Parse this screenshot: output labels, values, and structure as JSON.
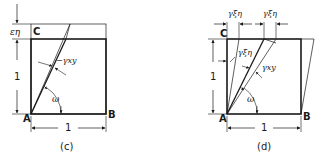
{
  "figures": [
    {
      "id": "c",
      "caption": "(c)",
      "vertices": {
        "A": "A",
        "B": "B",
        "C": "C"
      },
      "dimensions": {
        "height": "1",
        "width": "1",
        "top_offset": "εη"
      },
      "angles": {
        "shear": "−γxy",
        "rotation": "ω"
      }
    },
    {
      "id": "d",
      "caption": "(d)",
      "vertices": {
        "A": "A",
        "B": "B",
        "C": "C"
      },
      "dimensions": {
        "height": "1",
        "width": "1",
        "top_left": "γξη",
        "top_right": "γξη"
      },
      "angles": {
        "inner": "γξη",
        "shear": "γxy",
        "rotation": "ω"
      }
    }
  ],
  "colors": {
    "ink": "#1a1a1a",
    "background": "#ffffff"
  }
}
